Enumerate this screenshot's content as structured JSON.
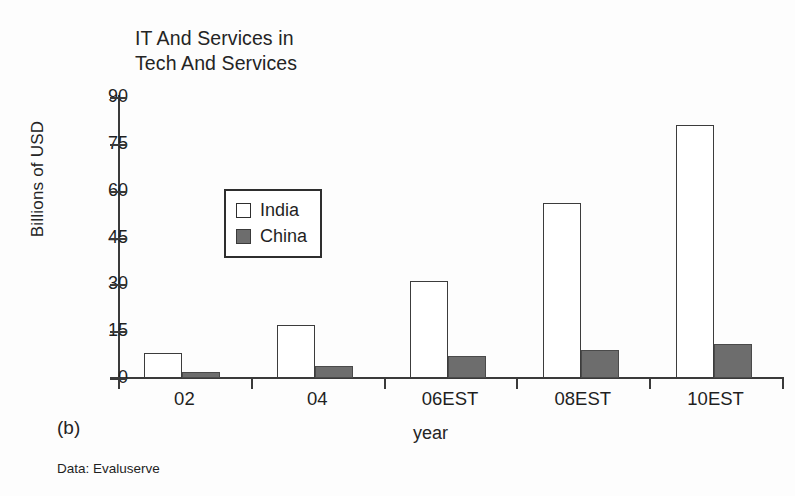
{
  "figure": {
    "panel_label": "(b)",
    "source_note": "Data: Evaluserve"
  },
  "chart_data": {
    "type": "bar",
    "title": "IT And Services in\nTech And Services",
    "xlabel": "year",
    "ylabel": "Billions of USD",
    "categories": [
      "02",
      "04",
      "06EST",
      "08EST",
      "10EST"
    ],
    "series": [
      {
        "name": "India",
        "values": [
          8,
          17,
          31,
          56,
          81
        ],
        "color": "#ffffff"
      },
      {
        "name": "China",
        "values": [
          2,
          4,
          7,
          9,
          11
        ],
        "color": "#6d6d6d"
      }
    ],
    "ylim": [
      0,
      90
    ],
    "yticks": [
      "0",
      "15",
      "30",
      "45",
      "60",
      "75",
      "90"
    ],
    "grid": false,
    "legend_position": "inside-upper-left",
    "legend_entries": [
      "India",
      "China"
    ]
  }
}
